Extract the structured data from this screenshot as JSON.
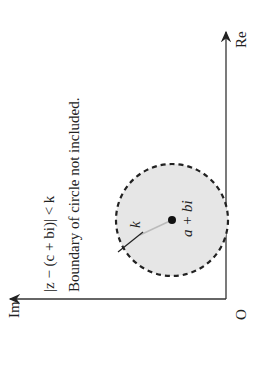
{
  "diagram": {
    "axes": {
      "real_label": "Re",
      "imag_label": "Im",
      "origin_label": "O"
    },
    "circle": {
      "center_label": "a + bi",
      "radius_label": "k",
      "boundary": "dashed",
      "fill_color": "#e6e6e6",
      "stroke_color": "#222222"
    },
    "annotations": {
      "inequality": "|z − (c + bi)| < k",
      "note": "Boundary of circle not included."
    }
  }
}
